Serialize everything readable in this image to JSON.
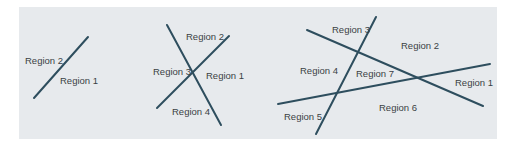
{
  "diagrams": [
    {
      "id": "one-line",
      "lines": 1,
      "regions": [
        {
          "label": "Region 2",
          "x": 25,
          "y": 64
        },
        {
          "label": "Region 1",
          "x": 60,
          "y": 84
        }
      ],
      "segments": [
        [
          34,
          98,
          88,
          37
        ]
      ]
    },
    {
      "id": "two-lines",
      "lines": 2,
      "regions": [
        {
          "label": "Region 2",
          "x": 186,
          "y": 40
        },
        {
          "label": "Region 3",
          "x": 153,
          "y": 75
        },
        {
          "label": "Region 1",
          "x": 206,
          "y": 79
        },
        {
          "label": "Region 4",
          "x": 172,
          "y": 115
        }
      ],
      "segments": [
        [
          167,
          25,
          221,
          125
        ],
        [
          157,
          108,
          229,
          36
        ]
      ]
    },
    {
      "id": "three-lines",
      "lines": 3,
      "regions": [
        {
          "label": "Region 3",
          "x": 332,
          "y": 33
        },
        {
          "label": "Region 2",
          "x": 401,
          "y": 49
        },
        {
          "label": "Region 4",
          "x": 300,
          "y": 74
        },
        {
          "label": "Region 7",
          "x": 356,
          "y": 77
        },
        {
          "label": "Region 1",
          "x": 455,
          "y": 86
        },
        {
          "label": "Region 6",
          "x": 379,
          "y": 111
        },
        {
          "label": "Region 5",
          "x": 284,
          "y": 120
        }
      ],
      "segments": [
        [
          307,
          30,
          483,
          106
        ],
        [
          278,
          104,
          490,
          64
        ],
        [
          316,
          134,
          376,
          17
        ]
      ]
    }
  ],
  "colors": {
    "background": "#e7eaed",
    "line": "#2e4e5e",
    "text": "#3a3f44"
  }
}
